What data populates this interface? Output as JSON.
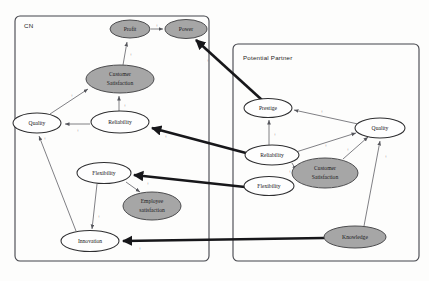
{
  "diagram": {
    "type": "causal-map",
    "panels": [
      {
        "id": "cn",
        "label": "CN"
      },
      {
        "id": "potential_partner",
        "label": "Potential Partner"
      }
    ],
    "colors": {
      "shaded_node_fill": "#a6a6a6",
      "plain_node_fill": "#fefefe",
      "node_stroke": "#2e2e30",
      "panel_stroke": "#43444a",
      "thick_arrow": "#17171a",
      "thin_arrow": "#55565c",
      "background": "#fdfdfc"
    },
    "nodes": [
      {
        "id": "cn_profit",
        "panel": "cn",
        "label": "Profit",
        "style": "shaded",
        "cx": 130,
        "cy": 29,
        "rx": 20,
        "ry": 9
      },
      {
        "id": "cn_power",
        "panel": "cn",
        "label": "Power",
        "style": "shaded",
        "cx": 186,
        "cy": 29,
        "rx": 21,
        "ry": 9.5
      },
      {
        "id": "cn_custsat",
        "panel": "cn",
        "label": "Customer Satisfaction",
        "style": "shaded",
        "cx": 120,
        "cy": 79,
        "rx": 34,
        "ry": 14,
        "lines": [
          "Customer",
          "Satisfaction"
        ]
      },
      {
        "id": "cn_quality",
        "panel": "cn",
        "label": "Quality",
        "style": "plain",
        "cx": 37,
        "cy": 123,
        "rx": 24,
        "ry": 10
      },
      {
        "id": "cn_reliability",
        "panel": "cn",
        "label": "Reliability",
        "style": "plain",
        "cx": 120,
        "cy": 122,
        "rx": 29,
        "ry": 11
      },
      {
        "id": "cn_flexibility",
        "panel": "cn",
        "label": "Flexibility",
        "style": "plain",
        "cx": 104,
        "cy": 173,
        "rx": 27,
        "ry": 10.5
      },
      {
        "id": "cn_empsat",
        "panel": "cn",
        "label": "Employee satisfaction",
        "style": "shaded",
        "cx": 152,
        "cy": 206,
        "rx": 29,
        "ry": 14,
        "lines": [
          "Employee",
          "satisfaction"
        ]
      },
      {
        "id": "cn_innovation",
        "panel": "cn",
        "label": "Innovation",
        "style": "plain",
        "cx": 90,
        "cy": 241,
        "rx": 29,
        "ry": 10.5
      },
      {
        "id": "pp_prestige",
        "panel": "potential_partner",
        "label": "Prestige",
        "style": "plain",
        "cx": 268,
        "cy": 108,
        "rx": 24,
        "ry": 9.5
      },
      {
        "id": "pp_quality",
        "panel": "potential_partner",
        "label": "Quality",
        "style": "plain",
        "cx": 380,
        "cy": 128,
        "rx": 25,
        "ry": 10
      },
      {
        "id": "pp_reliability",
        "panel": "potential_partner",
        "label": "Reliability",
        "style": "plain",
        "cx": 272,
        "cy": 155,
        "rx": 27,
        "ry": 10
      },
      {
        "id": "pp_custsat",
        "panel": "potential_partner",
        "label": "Customer Satisfaction",
        "style": "shaded",
        "cx": 325,
        "cy": 173,
        "rx": 33,
        "ry": 15,
        "lines": [
          "Customer",
          "Satisfaction"
        ]
      },
      {
        "id": "pp_flexibility",
        "panel": "potential_partner",
        "label": "Flexibility",
        "style": "plain",
        "cx": 269,
        "cy": 186,
        "rx": 25,
        "ry": 9.5
      },
      {
        "id": "pp_knowledge",
        "panel": "potential_partner",
        "label": "Knowledge",
        "style": "shaded",
        "cx": 355,
        "cy": 237,
        "rx": 31,
        "ry": 11
      }
    ],
    "edges": [
      {
        "from": "cn_profit",
        "to": "cn_power",
        "sign": "+",
        "weight": "thin"
      },
      {
        "from": "cn_custsat",
        "to": "cn_profit",
        "sign": "+",
        "weight": "thin"
      },
      {
        "from": "cn_reliability",
        "to": "cn_custsat",
        "sign": "+",
        "weight": "thin"
      },
      {
        "from": "cn_quality",
        "to": "cn_custsat",
        "sign": "+",
        "weight": "thin"
      },
      {
        "from": "cn_reliability",
        "to": "cn_quality",
        "sign": "+",
        "weight": "thin"
      },
      {
        "from": "cn_innovation",
        "to": "cn_quality",
        "sign": "+",
        "weight": "thin"
      },
      {
        "from": "cn_flexibility",
        "to": "cn_innovation",
        "sign": "+",
        "weight": "thin"
      },
      {
        "from": "cn_flexibility",
        "to": "cn_empsat",
        "sign": "",
        "weight": "thin"
      },
      {
        "from": "pp_prestige",
        "to": "cn_power",
        "sign": "+",
        "weight": "thick"
      },
      {
        "from": "pp_reliability",
        "to": "cn_reliability",
        "sign": "+",
        "weight": "thick"
      },
      {
        "from": "pp_flexibility",
        "to": "cn_flexibility",
        "sign": "+",
        "weight": "thick"
      },
      {
        "from": "pp_knowledge",
        "to": "cn_innovation",
        "sign": "+",
        "weight": "thick"
      },
      {
        "from": "pp_reliability",
        "to": "pp_prestige",
        "sign": "+",
        "weight": "thin"
      },
      {
        "from": "pp_quality",
        "to": "pp_prestige",
        "sign": "+",
        "weight": "thin"
      },
      {
        "from": "pp_reliability",
        "to": "pp_quality",
        "sign": "+",
        "weight": "thin"
      },
      {
        "from": "pp_custsat",
        "to": "pp_quality",
        "sign": "+",
        "weight": "thin"
      },
      {
        "from": "pp_knowledge",
        "to": "pp_quality",
        "sign": "+",
        "weight": "thin"
      },
      {
        "from": "pp_reliability",
        "to": "pp_custsat",
        "sign": "+",
        "weight": "thin"
      }
    ]
  }
}
